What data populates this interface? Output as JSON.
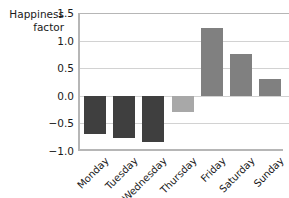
{
  "chart_data": {
    "type": "bar",
    "title": "",
    "xlabel": "",
    "ylabel": "Happiness\nfactor",
    "categories": [
      "Monday",
      "Tuesday",
      "Wednesday",
      "Thursday",
      "Friday",
      "Saturday",
      "Sunday"
    ],
    "values": [
      -0.7,
      -0.77,
      -0.83,
      -0.3,
      1.22,
      0.75,
      0.3
    ],
    "bar_colors": [
      "#3f3f3f",
      "#3f3f3f",
      "#3f3f3f",
      "#a8a8a8",
      "#808080",
      "#808080",
      "#808080"
    ],
    "ylim": [
      -1.0,
      1.5
    ],
    "ytick_labels": [
      "1.5",
      "1.0",
      "0.5",
      "0.0",
      "-0.5",
      "-1.0"
    ],
    "ytick_values": [
      1.5,
      1.0,
      0.5,
      0.0,
      -0.5,
      -1.0
    ],
    "grid": true,
    "grid_axis": "y",
    "legend": null,
    "xtick_rotation": -45
  },
  "colors": {
    "axis": "#b6b6b6",
    "grid": "#d2d2d2",
    "text": "#1a1a1a",
    "background": "#ffffff",
    "bar_negative": "#3f3f3f",
    "bar_negative_light": "#a8a8a8",
    "bar_positive": "#808080"
  }
}
